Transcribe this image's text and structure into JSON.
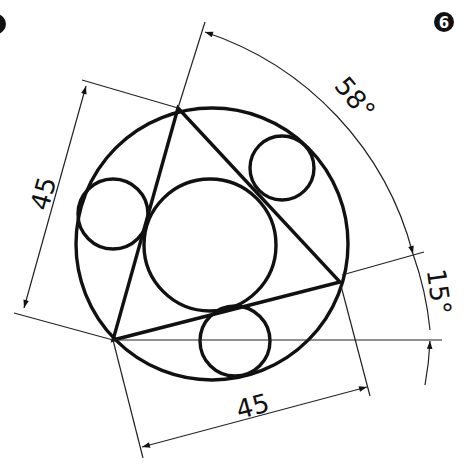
{
  "figure": {
    "badge_left": "",
    "badge_right": "6",
    "dimensions": {
      "side_left": "45",
      "side_bottom": "45",
      "angle_top": "58°",
      "angle_right": "15°"
    }
  },
  "colors": {
    "stroke": "#111111",
    "background": "#ffffff"
  }
}
